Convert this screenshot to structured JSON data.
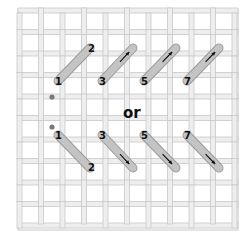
{
  "diagram": {
    "separator_label": "or",
    "colors": {
      "canvas_thread_fill": "#eeeeee",
      "canvas_thread_stroke": "#c8c8c8",
      "stitch_fill": "#c4c4c4",
      "stitch_stroke": "#9a9a9a",
      "start_dot": "#7a7a7a",
      "label": "#111111"
    },
    "top_row": {
      "direction": "up-right",
      "stitches": [
        {
          "start_label": "1",
          "end_label": "2",
          "x1": 58,
          "y1": 81,
          "x2": 90,
          "y2": 48
        },
        {
          "start_label": "3",
          "end_label": "",
          "x1": 102,
          "y1": 81,
          "x2": 133,
          "y2": 48
        },
        {
          "start_label": "5",
          "end_label": "",
          "x1": 144,
          "y1": 81,
          "x2": 176,
          "y2": 48
        },
        {
          "start_label": "7",
          "end_label": "",
          "x1": 187,
          "y1": 81,
          "x2": 219,
          "y2": 48
        }
      ],
      "start_dot": {
        "x": 52,
        "y": 97
      }
    },
    "bottom_row": {
      "direction": "down-right",
      "stitches": [
        {
          "start_label": "1",
          "end_label": "2",
          "x1": 58,
          "y1": 135,
          "x2": 90,
          "y2": 168
        },
        {
          "start_label": "3",
          "end_label": "",
          "x1": 102,
          "y1": 135,
          "x2": 133,
          "y2": 168
        },
        {
          "start_label": "5",
          "end_label": "",
          "x1": 144,
          "y1": 135,
          "x2": 176,
          "y2": 168
        },
        {
          "start_label": "7",
          "end_label": "",
          "x1": 187,
          "y1": 135,
          "x2": 219,
          "y2": 168
        }
      ],
      "start_dot": {
        "x": 52,
        "y": 127
      }
    },
    "labels": [
      "1",
      "2",
      "3",
      "5",
      "7",
      "or",
      "1",
      "2",
      "3",
      "5",
      "7"
    ]
  }
}
